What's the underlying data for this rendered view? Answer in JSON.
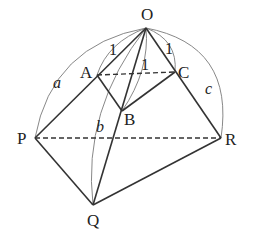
{
  "diagram": {
    "type": "geometry-3d-tetrahedron",
    "points": {
      "O": {
        "label": "O",
        "x": 146,
        "y": 28
      },
      "A": {
        "label": "A",
        "x": 97,
        "y": 75
      },
      "B": {
        "label": "B",
        "x": 122,
        "y": 111
      },
      "C": {
        "label": "C",
        "x": 175,
        "y": 72
      },
      "P": {
        "label": "P",
        "x": 35,
        "y": 138
      },
      "Q": {
        "label": "Q",
        "x": 93,
        "y": 205
      },
      "R": {
        "label": "R",
        "x": 221,
        "y": 138
      }
    },
    "edge_labels": {
      "OA": "1",
      "OB": "1",
      "OC": "1",
      "OP": "a",
      "OQ": "b",
      "OR": "c"
    },
    "solid_edges": [
      "O-P",
      "O-Q",
      "O-R",
      "A-B",
      "B-C",
      "P-Q",
      "Q-R"
    ],
    "dashed_edges": [
      "A-C",
      "P-R"
    ],
    "colors": {
      "line": "#333333",
      "arc": "#777777",
      "background": "#ffffff"
    }
  }
}
